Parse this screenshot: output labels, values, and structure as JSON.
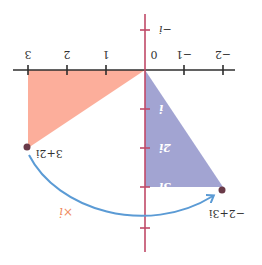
{
  "figure": {
    "orientation": "rotated-180",
    "colors": {
      "background": "#ffffff",
      "real_axis": "#2e2e2e",
      "imag_axis": "#c04a68",
      "triangle_original": "#fca792",
      "triangle_rotated": "#9d9fd0",
      "point": "#6a3a48",
      "arc": "#5b9bd5",
      "multiply_label": "#f08a60"
    },
    "real_axis": {
      "tick_labels": [
        "−2",
        "−1",
        "0",
        "1",
        "2",
        "3"
      ]
    },
    "imag_axis": {
      "tick_labels": [
        "−i",
        "i",
        "2i",
        "3i"
      ]
    },
    "points": [
      {
        "label": "3+2i",
        "re": 3,
        "im": 2
      },
      {
        "label": "−2+3i",
        "re": -2,
        "im": 3
      }
    ],
    "transformation": {
      "label": "×i",
      "description": "multiplication by i rotates 90° counterclockwise"
    },
    "triangles": [
      {
        "name": "original",
        "vertices": [
          "0",
          "3",
          "3+2i"
        ]
      },
      {
        "name": "rotated",
        "vertices": [
          "0",
          "3i",
          "−2+3i"
        ]
      }
    ]
  }
}
